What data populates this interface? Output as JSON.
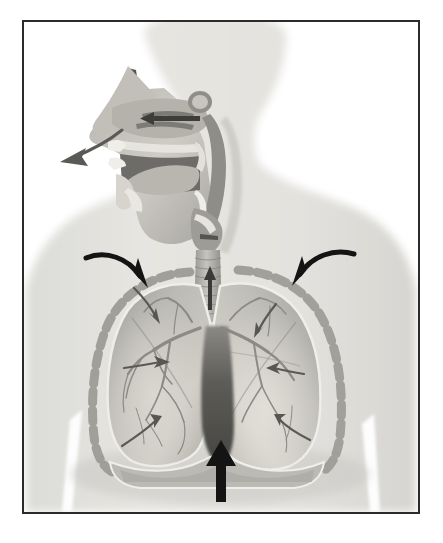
{
  "figure": {
    "kind": "anatomical-illustration",
    "phase": "exhalation",
    "caption_text": "",
    "colors": {
      "page_background": "#ffffff",
      "frame_border": "#2b2b2b",
      "body_silhouette": "#e2e2df",
      "body_silhouette_shadow": "#d2d2ce",
      "lung_fill": "#b3b2ad",
      "lung_highlight": "#cfcdc7",
      "lung_outline": "#efefea",
      "airway_fill": "#a9a8a3",
      "rib_marking": "#9b9a95",
      "mediastinum_shadow": "#4f4e4c",
      "bold_arrow": "#141414",
      "inner_arrow": "#5a5955",
      "trachea_arrow": "#3b3a38"
    },
    "frame": {
      "x": 22,
      "y": 20,
      "width": 398,
      "height": 494,
      "border_width": 2
    },
    "parts": [
      {
        "name": "body-silhouette",
        "label": "Head, neck and torso outline"
      },
      {
        "name": "head-sagittal-section",
        "label": "Sagittal section of head"
      },
      {
        "name": "nasal-cavity",
        "label": "Nasal cavity"
      },
      {
        "name": "oral-cavity",
        "label": "Oral cavity"
      },
      {
        "name": "tongue",
        "label": "Tongue"
      },
      {
        "name": "pharynx",
        "label": "Pharynx"
      },
      {
        "name": "larynx",
        "label": "Larynx"
      },
      {
        "name": "trachea",
        "label": "Trachea"
      },
      {
        "name": "bronchi",
        "label": "Primary bronchi"
      },
      {
        "name": "left-lung",
        "label": "Lung (viewer left)"
      },
      {
        "name": "right-lung",
        "label": "Lung (viewer right)"
      },
      {
        "name": "bronchial-tree",
        "label": "Bronchial tree"
      },
      {
        "name": "rib-cage-markings",
        "label": "Rib cage markings"
      },
      {
        "name": "diaphragm",
        "label": "Diaphragm"
      },
      {
        "name": "mediastinum",
        "label": "Mediastinum shadow"
      }
    ],
    "arrows": [
      {
        "name": "exhale-mouth-arrow",
        "direction": "down-left",
        "style": "curved-outline",
        "meaning": "air leaving through the mouth"
      },
      {
        "name": "nasal-airflow-arrow",
        "direction": "left",
        "style": "straight-dark",
        "meaning": "air leaving through the nasal cavity"
      },
      {
        "name": "trachea-up-arrow",
        "direction": "up",
        "style": "straight-dark",
        "meaning": "air moving up the trachea"
      },
      {
        "name": "ribcage-inward-arrow-left",
        "direction": "down-right",
        "style": "bold-curved-black",
        "meaning": "rib cage moving inward and downward"
      },
      {
        "name": "ribcage-inward-arrow-right",
        "direction": "down-left",
        "style": "bold-curved-black",
        "meaning": "rib cage moving inward and downward"
      },
      {
        "name": "diaphragm-up-arrow",
        "direction": "up",
        "style": "bold-straight-black",
        "meaning": "diaphragm relaxing upward"
      },
      {
        "name": "lung-recoil-arrow-left-upper",
        "direction": "down-right",
        "style": "thin-dark",
        "meaning": "lung recoil"
      },
      {
        "name": "lung-recoil-arrow-left-middle",
        "direction": "right",
        "style": "thin-dark",
        "meaning": "lung recoil"
      },
      {
        "name": "lung-recoil-arrow-left-lower",
        "direction": "up-right",
        "style": "thin-dark",
        "meaning": "lung recoil"
      },
      {
        "name": "lung-recoil-arrow-right-upper",
        "direction": "down-left",
        "style": "thin-dark",
        "meaning": "lung recoil"
      },
      {
        "name": "lung-recoil-arrow-right-middle",
        "direction": "left",
        "style": "thin-dark",
        "meaning": "lung recoil"
      },
      {
        "name": "lung-recoil-arrow-right-lower",
        "direction": "up-left",
        "style": "thin-dark",
        "meaning": "lung recoil"
      }
    ]
  }
}
